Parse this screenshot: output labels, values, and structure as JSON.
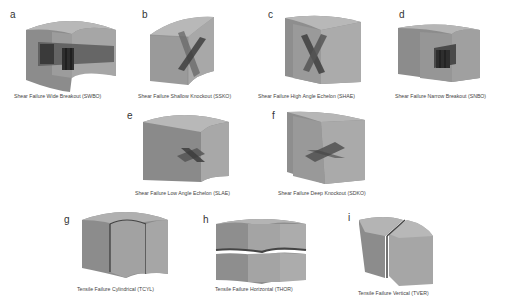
{
  "figure": {
    "panels": [
      {
        "letter": "a",
        "caption": "Shear Failure Wide Breakout (SWBO)"
      },
      {
        "letter": "b",
        "caption": "Shear Failure Shallow Knockout (SSKO)"
      },
      {
        "letter": "c",
        "caption": "Shear Failure High Angle Echelon (SHAE)"
      },
      {
        "letter": "d",
        "caption": "Shear Failure Narrow Breakout (SNBO)"
      },
      {
        "letter": "e",
        "caption": "Shear Failure Low Angle Echelon (SLAE)"
      },
      {
        "letter": "f",
        "caption": "Shear Failure Deep Knockout (SDKO)"
      },
      {
        "letter": "g",
        "caption": "Tensile Failure Cylindrical (TCYL)"
      },
      {
        "letter": "h",
        "caption": "Tensile Failure Horizontal (THOR)"
      },
      {
        "letter": "i",
        "caption": "Tensile Failure Vertical  (TVER)"
      }
    ],
    "colors": {
      "top_face": "#b4b4b4",
      "left_face": "#8c8c8c",
      "mid_face": "#9c9c9c",
      "right_face": "#a6a6a6",
      "fracture": "#555555",
      "fracture_dark": "#333333"
    }
  }
}
